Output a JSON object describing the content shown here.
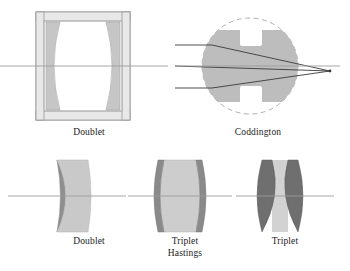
{
  "figure": {
    "background_color": "#ffffff",
    "width": 350,
    "height": 271
  },
  "palette": {
    "glass_light": "#c9c9c9",
    "glass_mid": "#b4b4b4",
    "glass_dark": "#6f6f6f",
    "glass_pale": "#d6d6d6",
    "mount_fill": "#e6e6e6",
    "mount_stroke": "#9a9a9a",
    "outline": "#8c8c8c",
    "axis_line": "#9d9d9d",
    "ray_line": "#3a3a3a",
    "dashed_circle": "#a8a8a8",
    "caption_text": "#1a1a1a"
  },
  "diagrams": [
    {
      "id": "doublet-top",
      "caption": "Doublet",
      "element_count": 2,
      "mounted": true,
      "axis": true
    },
    {
      "id": "coddington",
      "caption": "Coddington",
      "element_count": 1,
      "shape": "sphere-with-equatorial-groove",
      "rays": 3,
      "dashed_outline": true,
      "axis": true
    },
    {
      "id": "doublet-bottom",
      "caption": "Doublet",
      "element_count": 2,
      "mounted": false,
      "axis": true
    },
    {
      "id": "triplet-hastings",
      "caption": "Triplet\nHastings",
      "caption_line1": "Triplet",
      "caption_line2": "Hastings",
      "element_count": 3,
      "mounted": false,
      "axis": true
    },
    {
      "id": "triplet-right",
      "caption": "Triplet",
      "element_count": 3,
      "mounted": false,
      "axis": true
    }
  ]
}
